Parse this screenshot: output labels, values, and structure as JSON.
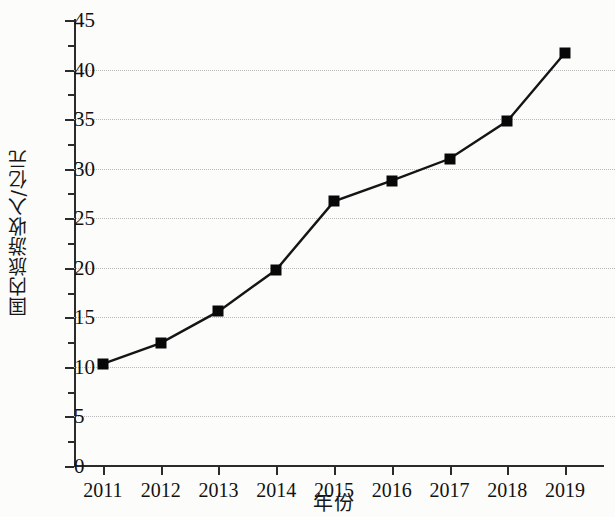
{
  "chart_data": {
    "type": "line",
    "title": "",
    "xlabel": "年份",
    "ylabel": "国内旅游收入/亿元",
    "categories": [
      "2011",
      "2012",
      "2013",
      "2014",
      "2015",
      "2016",
      "2017",
      "2018",
      "2019"
    ],
    "values": [
      10.3,
      12.4,
      15.6,
      19.8,
      26.7,
      28.8,
      31.0,
      34.8,
      41.7
    ],
    "series": [
      {
        "name": "国内旅游收入",
        "values": [
          10.3,
          12.4,
          15.6,
          19.8,
          26.7,
          28.8,
          31.0,
          34.8,
          41.7
        ]
      }
    ],
    "ylim": [
      0,
      45
    ],
    "yticks": [
      0,
      5,
      10,
      15,
      20,
      25,
      30,
      35,
      40,
      45
    ],
    "ytick_labels": [
      "0",
      "5",
      "10",
      "15",
      "20",
      "25",
      "30",
      "35",
      "40",
      "45"
    ],
    "yminor_ticks": [
      2.5,
      7.5,
      12.5,
      17.5,
      22.5,
      27.5,
      32.5,
      37.5,
      42.5
    ],
    "gridlines": [
      5,
      10,
      15,
      20,
      25,
      30,
      35,
      40
    ],
    "grid": true,
    "grid_axis": "y",
    "grid_style": "dotted",
    "legend": "none",
    "marker": "square",
    "marker_color": "#080808",
    "line_color": "#151515",
    "grid_color": "#b9b9b9",
    "axis_color": "#2b2b2b",
    "background": "#fcfcfa"
  }
}
